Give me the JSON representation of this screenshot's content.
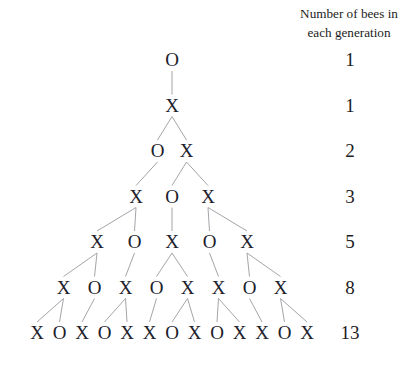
{
  "header": {
    "caption_line1": "Number of bees in",
    "caption_line2": "each generation"
  },
  "colors": {
    "text": "#20202a",
    "connector": "#9a9aa0",
    "background": "#ffffff"
  },
  "chart_data": {
    "type": "diagram",
    "title": "Number of bees in each generation",
    "symbols": {
      "male": "O",
      "female": "X"
    },
    "categories": [
      "1",
      "2",
      "3",
      "4",
      "5",
      "6",
      "7"
    ],
    "values": [
      1,
      1,
      2,
      3,
      5,
      8,
      13
    ],
    "ylabel": "Number of bees in each generation",
    "generations": [
      {
        "index": 1,
        "count": "1",
        "nodes": [
          "O"
        ]
      },
      {
        "index": 2,
        "count": "1",
        "nodes": [
          "X"
        ]
      },
      {
        "index": 3,
        "count": "2",
        "nodes": [
          "O",
          "X"
        ]
      },
      {
        "index": 4,
        "count": "3",
        "nodes": [
          "X",
          "O",
          "X"
        ]
      },
      {
        "index": 5,
        "count": "5",
        "nodes": [
          "X",
          "O",
          "X",
          "O",
          "X"
        ]
      },
      {
        "index": 6,
        "count": "8",
        "nodes": [
          "X",
          "O",
          "X",
          "O",
          "X",
          "X",
          "O",
          "X"
        ]
      },
      {
        "index": 7,
        "count": "13",
        "nodes": [
          "X",
          "O",
          "X",
          "O",
          "X",
          "X",
          "O",
          "X",
          "O",
          "X",
          "X",
          "O",
          "X"
        ]
      }
    ]
  }
}
